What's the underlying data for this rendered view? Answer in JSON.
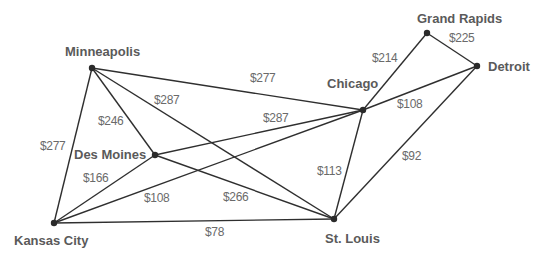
{
  "diagram": {
    "type": "weighted-graph",
    "nodes": [
      {
        "id": "minneapolis",
        "label": "Minneapolis",
        "x": 92,
        "y": 68,
        "lx": 65,
        "ly": 56,
        "anchor": "start"
      },
      {
        "id": "des_moines",
        "label": "Des Moines",
        "x": 155,
        "y": 155,
        "lx": 74,
        "ly": 159,
        "anchor": "start"
      },
      {
        "id": "kansas_city",
        "label": "Kansas City",
        "x": 54,
        "y": 223,
        "lx": 14,
        "ly": 245,
        "anchor": "start"
      },
      {
        "id": "st_louis",
        "label": "St. Louis",
        "x": 334,
        "y": 219,
        "lx": 325,
        "ly": 243,
        "anchor": "start"
      },
      {
        "id": "chicago",
        "label": "Chicago",
        "x": 363,
        "y": 110,
        "lx": 327,
        "ly": 88,
        "anchor": "start"
      },
      {
        "id": "grand_rapids",
        "label": "Grand Rapids",
        "x": 427,
        "y": 33,
        "lx": 417,
        "ly": 23,
        "anchor": "start"
      },
      {
        "id": "detroit",
        "label": "Detroit",
        "x": 477,
        "y": 66,
        "lx": 488,
        "ly": 71,
        "anchor": "start"
      }
    ],
    "edges": [
      {
        "from": "minneapolis",
        "to": "chicago",
        "cost": "$277",
        "lx": 250,
        "ly": 82
      },
      {
        "from": "minneapolis",
        "to": "st_louis",
        "cost": "$287",
        "lx": 154,
        "ly": 104
      },
      {
        "from": "minneapolis",
        "to": "des_moines",
        "cost": "$246",
        "lx": 98,
        "ly": 125
      },
      {
        "from": "minneapolis",
        "to": "kansas_city",
        "cost": "$277",
        "lx": 40,
        "ly": 150
      },
      {
        "from": "des_moines",
        "to": "chicago",
        "cost": "$287",
        "lx": 263,
        "ly": 122
      },
      {
        "from": "des_moines",
        "to": "st_louis",
        "cost": "$266",
        "lx": 223,
        "ly": 201
      },
      {
        "from": "des_moines",
        "to": "kansas_city",
        "cost": "$166",
        "lx": 83,
        "ly": 182
      },
      {
        "from": "kansas_city",
        "to": "chicago",
        "cost": "$108",
        "lx": 144,
        "ly": 202
      },
      {
        "from": "kansas_city",
        "to": "st_louis",
        "cost": "$78",
        "lx": 205,
        "ly": 236
      },
      {
        "from": "st_louis",
        "to": "chicago",
        "cost": "$113",
        "lx": 317,
        "ly": 175
      },
      {
        "from": "st_louis",
        "to": "detroit",
        "cost": "$92",
        "lx": 402,
        "ly": 160
      },
      {
        "from": "chicago",
        "to": "grand_rapids",
        "cost": "$214",
        "lx": 372,
        "ly": 62
      },
      {
        "from": "chicago",
        "to": "detroit",
        "cost": "$108",
        "lx": 397,
        "ly": 108
      },
      {
        "from": "grand_rapids",
        "to": "detroit",
        "cost": "$225",
        "lx": 449,
        "ly": 42
      }
    ],
    "colors": {
      "edge": "#2f2f2f",
      "node": "#2a2a2a",
      "city_label": "#5a5a5a",
      "cost_label": "#6a6a6a",
      "background": "#ffffff"
    }
  }
}
